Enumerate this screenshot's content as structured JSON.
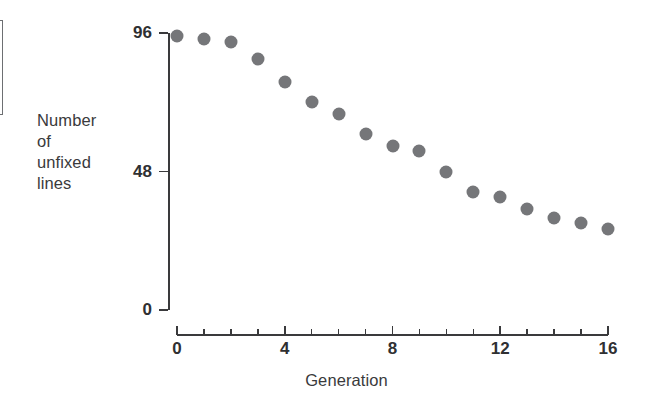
{
  "chart_data": {
    "type": "scatter",
    "title": "",
    "xlabel": "Generation",
    "ylabel": "Number of unfixed lines",
    "ylabel_lines": [
      "Number",
      "of",
      "unfixed",
      "lines"
    ],
    "xlim": [
      0,
      16
    ],
    "ylim": [
      0,
      96
    ],
    "x_ticks": [
      0,
      4,
      8,
      12,
      16
    ],
    "x_tick_labels": [
      "0",
      "4",
      "8",
      "12",
      "16"
    ],
    "x_minor_tick_step": 1,
    "y_ticks": [
      0,
      48,
      96
    ],
    "y_tick_labels": [
      "0",
      "48",
      "96"
    ],
    "grid": false,
    "legend": null,
    "marker": {
      "shape": "circle",
      "color": "#757679",
      "size_px": 13
    },
    "x": [
      0,
      1,
      2,
      3,
      4,
      5,
      6,
      7,
      8,
      9,
      10,
      11,
      12,
      13,
      14,
      15,
      16
    ],
    "values": [
      95,
      94,
      93,
      87,
      79,
      72,
      68,
      61,
      57,
      55,
      48,
      41,
      39,
      35,
      32,
      30,
      28
    ],
    "points": [
      {
        "x": 0,
        "y": 95
      },
      {
        "x": 1,
        "y": 94
      },
      {
        "x": 2,
        "y": 93
      },
      {
        "x": 3,
        "y": 87
      },
      {
        "x": 4,
        "y": 79
      },
      {
        "x": 5,
        "y": 72
      },
      {
        "x": 6,
        "y": 68
      },
      {
        "x": 7,
        "y": 61
      },
      {
        "x": 8,
        "y": 57
      },
      {
        "x": 9,
        "y": 55
      },
      {
        "x": 10,
        "y": 48
      },
      {
        "x": 11,
        "y": 41
      },
      {
        "x": 12,
        "y": 39
      },
      {
        "x": 13,
        "y": 35
      },
      {
        "x": 14,
        "y": 32
      },
      {
        "x": 15,
        "y": 30
      },
      {
        "x": 16,
        "y": 28
      }
    ]
  },
  "colors": {
    "marker": "#757679",
    "axis": "#3a3a3c",
    "tick_label": "#2f3032",
    "background": "#ffffff",
    "crop_box_border": "#6d6f72"
  }
}
